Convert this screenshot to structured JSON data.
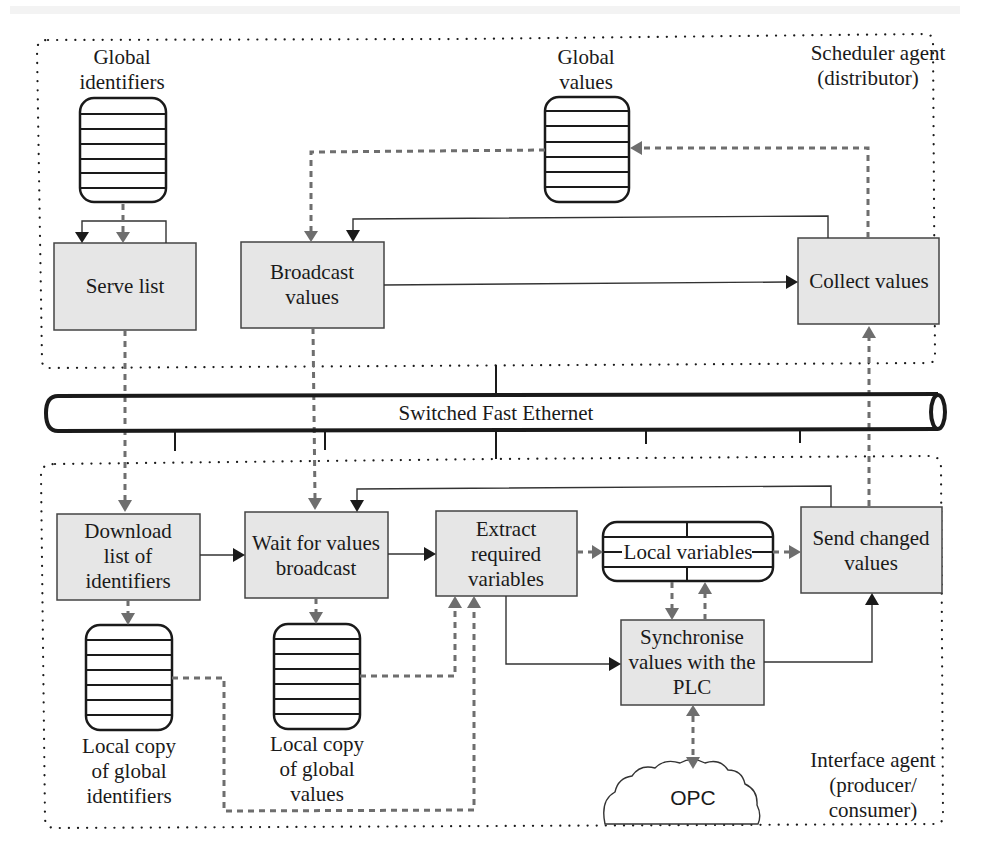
{
  "diagram": {
    "regions": {
      "scheduler": {
        "label_line1": "Scheduler agent",
        "label_line2": "(distributor)"
      },
      "interface": {
        "label_line1": "Interface agent",
        "label_line2": "(producer/",
        "label_line3": "consumer)"
      }
    },
    "network": {
      "label": "Switched Fast Ethernet"
    },
    "stores": {
      "global_identifiers": {
        "line1": "Global",
        "line2": "identifiers"
      },
      "global_values": {
        "line1": "Global",
        "line2": "values"
      },
      "local_ids": {
        "line1": "Local copy",
        "line2": "of global",
        "line3": "identifiers"
      },
      "local_values": {
        "line1": "Local copy",
        "line2": "of global",
        "line3": "values"
      },
      "local_variables": {
        "label": "Local variables"
      }
    },
    "processes": {
      "serve_list": {
        "line1": "Serve list"
      },
      "broadcast_values": {
        "line1": "Broadcast",
        "line2": "values"
      },
      "collect_values": {
        "line1": "Collect values"
      },
      "download_list": {
        "line1": "Download",
        "line2": "list of",
        "line3": "identifiers"
      },
      "wait_broadcast": {
        "line1": "Wait for values",
        "line2": "broadcast"
      },
      "extract_vars": {
        "line1": "Extract",
        "line2": "required",
        "line3": "variables"
      },
      "send_changed": {
        "line1": "Send changed",
        "line2": "values"
      },
      "synchronise": {
        "line1": "Synchronise",
        "line2": "values with the",
        "line3": "PLC"
      }
    },
    "external": {
      "opc": {
        "label": "OPC"
      }
    },
    "legend_colors": {
      "control_flow": "#333333",
      "data_flow": "#6e6e6e",
      "process_fill": "#e6e6e6"
    }
  }
}
